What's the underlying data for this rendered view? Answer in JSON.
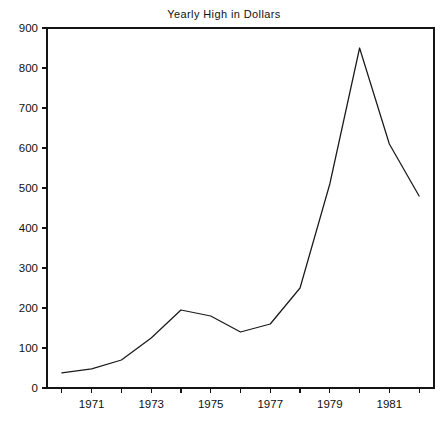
{
  "chart_data": {
    "type": "line",
    "title": "Yearly High in Dollars",
    "xlabel": "",
    "ylabel": "",
    "x": [
      1970,
      1971,
      1972,
      1973,
      1974,
      1975,
      1976,
      1977,
      1978,
      1979,
      1980,
      1981,
      1982
    ],
    "values": [
      38,
      48,
      70,
      125,
      195,
      180,
      140,
      160,
      250,
      510,
      850,
      610,
      480
    ],
    "series": [
      {
        "name": "Yearly High",
        "values": [
          38,
          48,
          70,
          125,
          195,
          180,
          140,
          160,
          250,
          510,
          850,
          610,
          480
        ]
      }
    ],
    "xlim": [
      1969.5,
      1982.5
    ],
    "ylim": [
      0,
      900
    ],
    "ytick_values": [
      0,
      100,
      200,
      300,
      400,
      500,
      600,
      700,
      800,
      900
    ],
    "ytick_labels": [
      "0",
      "100",
      "200",
      "300",
      "400",
      "500",
      "600",
      "700",
      "800",
      "900"
    ],
    "xtick_values": [
      1970,
      1971,
      1972,
      1973,
      1974,
      1975,
      1976,
      1977,
      1978,
      1979,
      1980,
      1981,
      1982
    ],
    "xtick_labels": [
      "",
      "1971",
      "",
      "1973",
      "",
      "1975",
      "",
      "1977",
      "",
      "1979",
      "",
      "1981",
      ""
    ],
    "grid": false,
    "legend": "none",
    "line_color": "#1a1a1a",
    "axis_color": "#141414",
    "background": "#ffffff"
  }
}
